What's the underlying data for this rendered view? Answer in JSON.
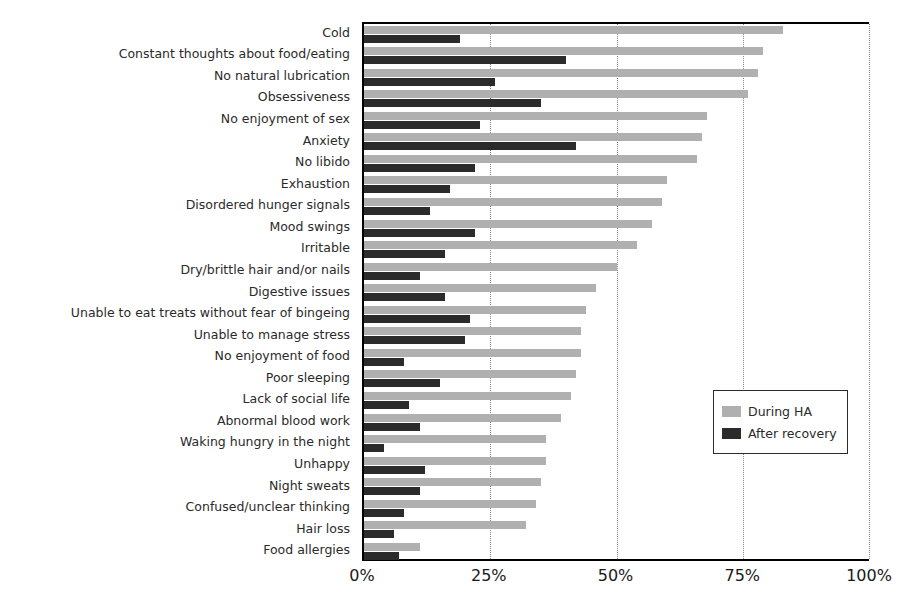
{
  "chart_data": {
    "type": "bar",
    "orientation": "horizontal",
    "title": "",
    "subtitle": "",
    "xlabel": "",
    "ylabel": "",
    "xlim": [
      0,
      100
    ],
    "xticks": [
      0,
      25,
      50,
      75,
      100
    ],
    "xtick_labels": [
      "0%",
      "25%",
      "50%",
      "75%",
      "100%"
    ],
    "grid": "vertical-dotted",
    "legend_position": "center-right",
    "colors": {
      "during_ha": "#b0b0b0",
      "after_recovery": "#2b2b2b",
      "axis": "#000000",
      "grid": "#888888",
      "text": "#2a2a2a"
    },
    "categories": [
      "Cold",
      "Constant thoughts about food/eating",
      "No natural lubrication",
      "Obsessiveness",
      "No enjoyment of sex",
      "Anxiety",
      "No libido",
      "Exhaustion",
      "Disordered hunger signals",
      "Mood swings",
      "Irritable",
      "Dry/brittle hair and/or nails",
      "Digestive issues",
      "Unable to eat treats without fear of bingeing",
      "Unable to manage stress",
      "No enjoyment of food",
      "Poor sleeping",
      "Lack of social life",
      "Abnormal blood work",
      "Waking hungry in the night",
      "Unhappy",
      "Night sweats",
      "Confused/unclear thinking",
      "Hair loss",
      "Food allergies"
    ],
    "series": [
      {
        "name": "During HA",
        "color": "#b0b0b0",
        "values": [
          83,
          79,
          78,
          76,
          68,
          67,
          66,
          60,
          59,
          57,
          54,
          50,
          46,
          44,
          43,
          43,
          42,
          41,
          39,
          36,
          36,
          35,
          34,
          32,
          11
        ]
      },
      {
        "name": "After recovery",
        "color": "#2b2b2b",
        "values": [
          19,
          40,
          26,
          35,
          23,
          42,
          22,
          17,
          13,
          22,
          16,
          11,
          16,
          21,
          20,
          8,
          15,
          9,
          11,
          4,
          12,
          11,
          8,
          6,
          7
        ]
      }
    ]
  },
  "legend": {
    "entries": [
      {
        "label": "During HA"
      },
      {
        "label": "After recovery"
      }
    ]
  }
}
